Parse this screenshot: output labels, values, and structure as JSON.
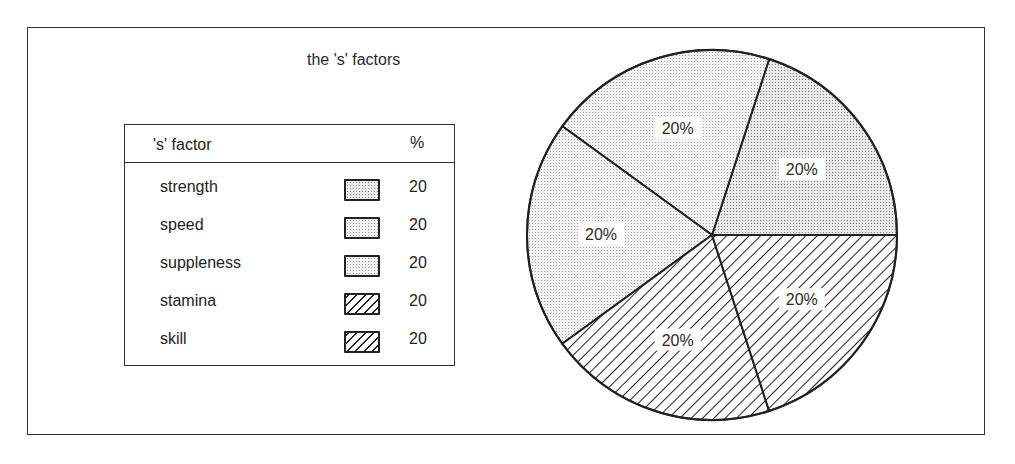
{
  "chart_data": {
    "type": "pie",
    "title": "the 's' factors",
    "categories": [
      "strength",
      "speed",
      "suppleness",
      "stamina",
      "skill"
    ],
    "values": [
      20,
      20,
      20,
      20,
      20
    ],
    "slice_labels": [
      "20%",
      "20%",
      "20%",
      "20%",
      "20%"
    ],
    "legend": {
      "position": "left",
      "header": {
        "label": "'s' factor",
        "value": "%"
      },
      "entries": [
        {
          "label": "strength",
          "value": "20",
          "pattern": "dots-dark"
        },
        {
          "label": "speed",
          "value": "20",
          "pattern": "dots"
        },
        {
          "label": "suppleness",
          "value": "20",
          "pattern": "dots"
        },
        {
          "label": "stamina",
          "value": "20",
          "pattern": "hatch"
        },
        {
          "label": "skill",
          "value": "20",
          "pattern": "hatch"
        }
      ]
    },
    "colors": {
      "stroke": "#222222",
      "dot_fill": "#f0f0f0",
      "hatch_line": "#222222"
    }
  }
}
